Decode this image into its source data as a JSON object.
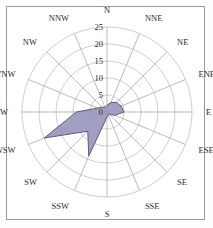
{
  "figure": {
    "kind": "wind-rose",
    "background_color": "#ffffff",
    "frame_color": "#9b9b9b",
    "grid_color": "#b9b9b9",
    "axis_color": "#9e9e9e",
    "series_fill": "#9a98bd",
    "series_stroke": "#5d5a80",
    "label_color": "#2b2b2b"
  },
  "chart_data": {
    "type": "line",
    "subtype": "radar-windrose",
    "title": "",
    "subtitle": "",
    "xlabel": "",
    "ylabel": "",
    "grid": true,
    "legend": "none",
    "closed": true,
    "center": {
      "x": 107,
      "y": 112
    },
    "outer_radius_px": 85,
    "categories": [
      "N",
      "NNE",
      "NE",
      "ENE",
      "E",
      "ESE",
      "SE",
      "SSE",
      "S",
      "SSW",
      "SW",
      "WSW",
      "W",
      "WNW",
      "NW",
      "NNW"
    ],
    "category_angles_deg": [
      0,
      22.5,
      45,
      67.5,
      90,
      112.5,
      135,
      157.5,
      180,
      202.5,
      225,
      247.5,
      270,
      292.5,
      315,
      337.5
    ],
    "values": [
      2.0,
      3.0,
      4.0,
      4.5,
      5.0,
      2.5,
      1.0,
      1.0,
      1.5,
      14.0,
      8.0,
      20.0,
      9.0,
      3.0,
      2.0,
      1.5
    ],
    "series": [
      {
        "name": "frequency",
        "values": [
          2.0,
          3.0,
          4.0,
          4.5,
          5.0,
          2.5,
          1.0,
          1.0,
          1.5,
          14.0,
          8.0,
          20.0,
          9.0,
          3.0,
          2.0,
          1.5
        ]
      }
    ],
    "rlim": [
      0,
      25
    ],
    "rticks": [
      0,
      5,
      10,
      15,
      20,
      25
    ],
    "rtick_labels": [
      "0",
      "5",
      "10",
      "15",
      "20",
      "25"
    ],
    "rtick_label_angle_deg": 0,
    "direction": "clockwise",
    "theta_zero_location": "N"
  },
  "labels": {
    "radial": [
      "0",
      "5",
      "10",
      "15",
      "20",
      "25"
    ],
    "compass": [
      "N",
      "NNE",
      "NE",
      "ENE",
      "E",
      "ESE",
      "SE",
      "SSE",
      "S",
      "SSW",
      "SW",
      "WSW",
      "W",
      "WNW",
      "NW",
      "NNW"
    ]
  }
}
